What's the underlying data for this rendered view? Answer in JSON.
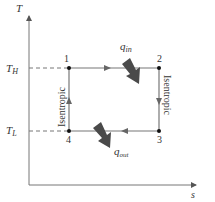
{
  "diagram": {
    "type": "T-s diagram (Carnot cycle)",
    "axes": {
      "y_label": "T",
      "x_label": "s"
    },
    "levels": {
      "high": {
        "symbol": "T",
        "subscript": "H"
      },
      "low": {
        "symbol": "T",
        "subscript": "L"
      }
    },
    "states": [
      {
        "id": "1",
        "label": "1"
      },
      {
        "id": "2",
        "label": "2"
      },
      {
        "id": "3",
        "label": "3"
      },
      {
        "id": "4",
        "label": "4"
      }
    ],
    "processes": [
      {
        "from": "1",
        "to": "2",
        "direction": "right",
        "label": ""
      },
      {
        "from": "2",
        "to": "3",
        "direction": "down",
        "label": "Isentropic"
      },
      {
        "from": "3",
        "to": "4",
        "direction": "left",
        "label": ""
      },
      {
        "from": "4",
        "to": "1",
        "direction": "up",
        "label": "Isentropic"
      }
    ],
    "heat": {
      "in": {
        "symbol": "q",
        "subscript": "in"
      },
      "out": {
        "symbol": "q",
        "subscript": "out"
      }
    },
    "colors": {
      "line": "#777777",
      "heat_arrow": "#4a4a4a",
      "point": "#111111",
      "text": "#333333"
    }
  }
}
